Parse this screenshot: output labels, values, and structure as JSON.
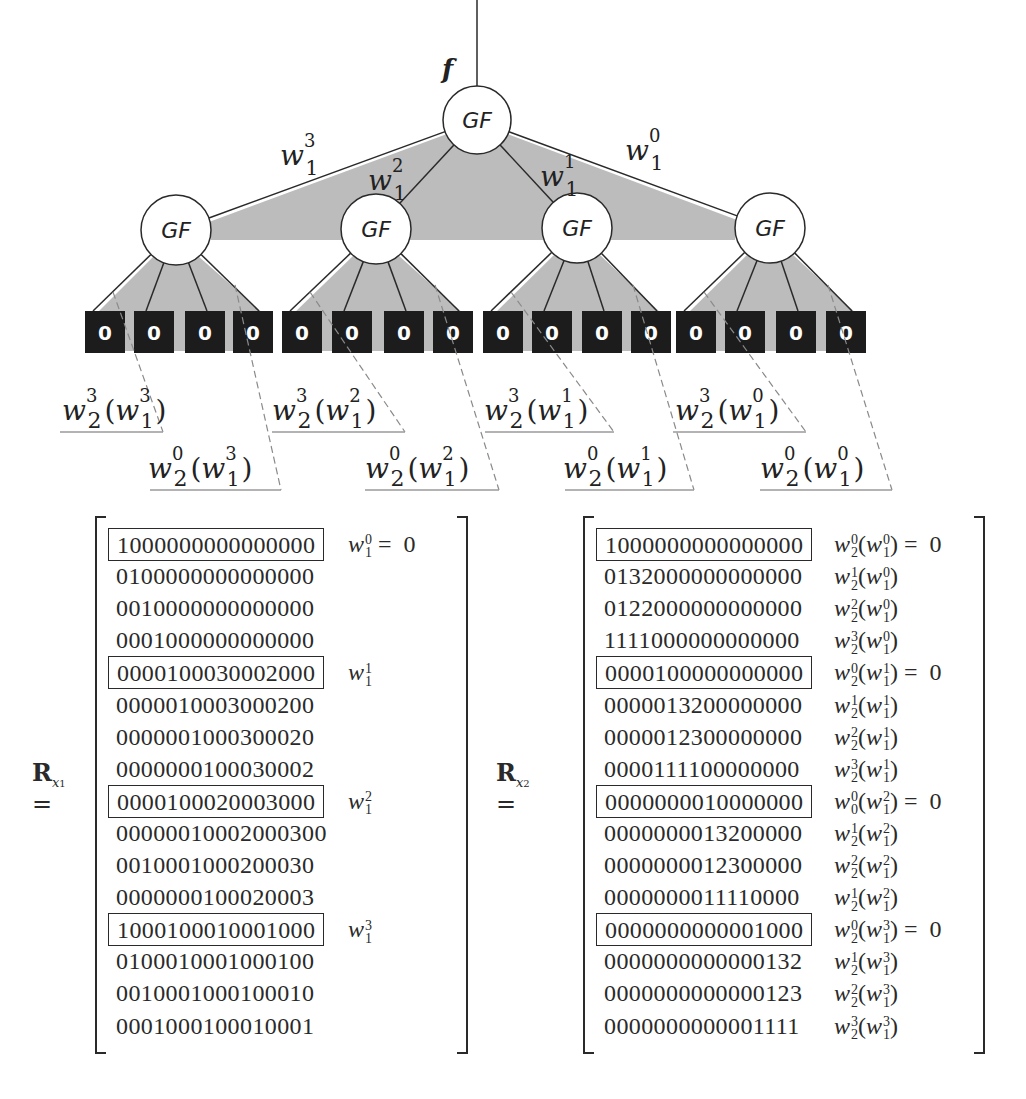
{
  "diagram": {
    "input_label": "f",
    "root": {
      "label": "GF",
      "cx": 477,
      "cy": 120,
      "r": 34
    },
    "edge_labels": [
      {
        "base": "w",
        "sup": "3",
        "sub": "1",
        "x": 280,
        "y": 165
      },
      {
        "base": "w",
        "sup": "2",
        "sub": "1",
        "x": 368,
        "y": 190
      },
      {
        "base": "w",
        "sup": "1",
        "sub": "1",
        "x": 540,
        "y": 186
      },
      {
        "base": "w",
        "sup": "0",
        "sub": "1",
        "x": 625,
        "y": 160
      }
    ],
    "level1_nodes": [
      {
        "label": "GF",
        "cx": 176,
        "cy": 230,
        "r": 35
      },
      {
        "label": "GF",
        "cx": 376,
        "cy": 229,
        "r": 35
      },
      {
        "label": "GF",
        "cx": 577,
        "cy": 228,
        "r": 35
      },
      {
        "label": "GF",
        "cx": 770,
        "cy": 228,
        "r": 35
      }
    ],
    "leaf_value": "0",
    "leaves": [
      {
        "x": 85
      },
      {
        "x": 134
      },
      {
        "x": 185
      },
      {
        "x": 233
      },
      {
        "x": 282
      },
      {
        "x": 332
      },
      {
        "x": 384
      },
      {
        "x": 433
      },
      {
        "x": 483
      },
      {
        "x": 532
      },
      {
        "x": 582
      },
      {
        "x": 631
      },
      {
        "x": 676
      },
      {
        "x": 725
      },
      {
        "x": 776
      },
      {
        "x": 826
      }
    ],
    "subband_labels": [
      {
        "text_base": "w",
        "sup": "3",
        "sub": "2",
        "inner_sup": "3",
        "x": 62,
        "y": 420,
        "line_x1": 60,
        "line_x2": 163
      },
      {
        "text_base": "w",
        "sup": "0",
        "sub": "2",
        "inner_sup": "3",
        "x": 148,
        "y": 478,
        "line_x1": 150,
        "line_x2": 281
      },
      {
        "text_base": "w",
        "sup": "3",
        "sub": "2",
        "inner_sup": "2",
        "x": 272,
        "y": 420,
        "line_x1": 272,
        "line_x2": 405
      },
      {
        "text_base": "w",
        "sup": "0",
        "sub": "2",
        "inner_sup": "2",
        "x": 365,
        "y": 478,
        "line_x1": 365,
        "line_x2": 499
      },
      {
        "text_base": "w",
        "sup": "3",
        "sub": "2",
        "inner_sup": "1",
        "x": 484,
        "y": 420,
        "line_x1": 485,
        "line_x2": 614
      },
      {
        "text_base": "w",
        "sup": "0",
        "sub": "2",
        "inner_sup": "1",
        "x": 563,
        "y": 478,
        "line_x1": 565,
        "line_x2": 694
      },
      {
        "text_base": "w",
        "sup": "3",
        "sub": "2",
        "inner_sup": "0",
        "x": 675,
        "y": 420,
        "line_x1": 673,
        "line_x2": 806
      },
      {
        "text_base": "w",
        "sup": "0",
        "sub": "2",
        "inner_sup": "0",
        "x": 760,
        "y": 478,
        "line_x1": 760,
        "line_x2": 892
      }
    ]
  },
  "matrices": [
    {
      "name": "R",
      "subscript": "x",
      "subsub": "1",
      "rows": [
        {
          "bits": "1000000000000000",
          "boxed": true,
          "ann": {
            "base": "w",
            "sup": "0",
            "sub": "1",
            "inner": null,
            "eq": "= 0"
          }
        },
        {
          "bits": "0100000000000000",
          "boxed": false,
          "ann": null
        },
        {
          "bits": "0010000000000000",
          "boxed": false,
          "ann": null
        },
        {
          "bits": "0001000000000000",
          "boxed": false,
          "ann": null
        },
        {
          "bits": "0000100030002000",
          "boxed": true,
          "ann": {
            "base": "w",
            "sup": "1",
            "sub": "1",
            "inner": null,
            "eq": ""
          }
        },
        {
          "bits": "0000010003000200",
          "boxed": false,
          "ann": null
        },
        {
          "bits": "0000001000300020",
          "boxed": false,
          "ann": null
        },
        {
          "bits": "0000000100030002",
          "boxed": false,
          "ann": null
        },
        {
          "bits": "0000100020003000",
          "boxed": true,
          "ann": {
            "base": "w",
            "sup": "2",
            "sub": "1",
            "inner": null,
            "eq": ""
          }
        },
        {
          "bits": "00000010002000300",
          "boxed": false,
          "ann": null
        },
        {
          "bits": "0010001000200030",
          "boxed": false,
          "ann": null
        },
        {
          "bits": "0000000100020003",
          "boxed": false,
          "ann": null
        },
        {
          "bits": "1000100010001000",
          "boxed": true,
          "ann": {
            "base": "w",
            "sup": "3",
            "sub": "1",
            "inner": null,
            "eq": ""
          }
        },
        {
          "bits": "0100010001000100",
          "boxed": false,
          "ann": null
        },
        {
          "bits": "0010001000100010",
          "boxed": false,
          "ann": null
        },
        {
          "bits": "0001000100010001",
          "boxed": false,
          "ann": null
        }
      ]
    },
    {
      "name": "R",
      "subscript": "x",
      "subsub": "2",
      "rows": [
        {
          "bits": "1000000000000000",
          "boxed": true,
          "ann": {
            "base": "w",
            "sup": "0",
            "sub": "2",
            "inner": {
              "sup": "0",
              "sub": "1"
            },
            "eq": "= 0"
          }
        },
        {
          "bits": "0132000000000000",
          "boxed": false,
          "ann": {
            "base": "w",
            "sup": "1",
            "sub": "2",
            "inner": {
              "sup": "0",
              "sub": "1"
            },
            "eq": ""
          }
        },
        {
          "bits": "0122000000000000",
          "boxed": false,
          "ann": {
            "base": "w",
            "sup": "2",
            "sub": "2",
            "inner": {
              "sup": "0",
              "sub": "1"
            },
            "eq": ""
          }
        },
        {
          "bits": "1111000000000000",
          "boxed": false,
          "ann": {
            "base": "w",
            "sup": "3",
            "sub": "2",
            "inner": {
              "sup": "0",
              "sub": "1"
            },
            "eq": ""
          }
        },
        {
          "bits": "0000100000000000",
          "boxed": true,
          "ann": {
            "base": "w",
            "sup": "0",
            "sub": "2",
            "inner": {
              "sup": "1",
              "sub": "1"
            },
            "eq": "= 0"
          }
        },
        {
          "bits": "0000013200000000",
          "boxed": false,
          "ann": {
            "base": "w",
            "sup": "1",
            "sub": "2",
            "inner": {
              "sup": "1",
              "sub": "1"
            },
            "eq": ""
          }
        },
        {
          "bits": "0000012300000000",
          "boxed": false,
          "ann": {
            "base": "w",
            "sup": "2",
            "sub": "2",
            "inner": {
              "sup": "1",
              "sub": "1"
            },
            "eq": ""
          }
        },
        {
          "bits": "0000111100000000",
          "boxed": false,
          "ann": {
            "base": "w",
            "sup": "3",
            "sub": "2",
            "inner": {
              "sup": "1",
              "sub": "1"
            },
            "eq": ""
          }
        },
        {
          "bits": "0000000010000000",
          "boxed": true,
          "ann": {
            "base": "w",
            "sup": "0",
            "sub": "0",
            "inner": {
              "sup": "2",
              "sub": "1"
            },
            "eq": "= 0"
          }
        },
        {
          "bits": "0000000013200000",
          "boxed": false,
          "ann": {
            "base": "w",
            "sup": "1",
            "sub": "2",
            "inner": {
              "sup": "2",
              "sub": "1"
            },
            "eq": ""
          }
        },
        {
          "bits": "0000000012300000",
          "boxed": false,
          "ann": {
            "base": "w",
            "sup": "2",
            "sub": "2",
            "inner": {
              "sup": "2",
              "sub": "1"
            },
            "eq": ""
          }
        },
        {
          "bits": "0000000011110000",
          "boxed": false,
          "ann": {
            "base": "w",
            "sup": "1",
            "sub": "2",
            "inner": {
              "sup": "2",
              "sub": "1"
            },
            "eq": ""
          }
        },
        {
          "bits": "0000000000001000",
          "boxed": true,
          "ann": {
            "base": "w",
            "sup": "0",
            "sub": "2",
            "inner": {
              "sup": "3",
              "sub": "1"
            },
            "eq": "= 0"
          }
        },
        {
          "bits": "0000000000000132",
          "boxed": false,
          "ann": {
            "base": "w",
            "sup": "1",
            "sub": "2",
            "inner": {
              "sup": "3",
              "sub": "1"
            },
            "eq": ""
          }
        },
        {
          "bits": "0000000000000123",
          "boxed": false,
          "ann": {
            "base": "w",
            "sup": "2",
            "sub": "2",
            "inner": {
              "sup": "3",
              "sub": "1"
            },
            "eq": ""
          }
        },
        {
          "bits": "0000000000001111",
          "boxed": false,
          "ann": {
            "base": "w",
            "sup": "3",
            "sub": "2",
            "inner": {
              "sup": "3",
              "sub": "1"
            },
            "eq": ""
          }
        }
      ]
    }
  ],
  "colors": {
    "shade": "#bcbcbc",
    "leaf_fill": "#1c1c1c",
    "stroke": "#2a2a2a",
    "dashed": "#8a8a8a",
    "underline": "#9a9a9a"
  }
}
